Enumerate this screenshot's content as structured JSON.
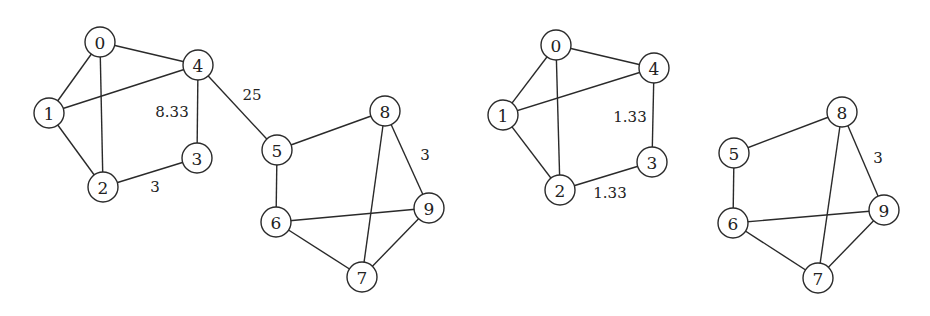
{
  "style": {
    "stroke": "#2a2a2a",
    "background": "#ffffff",
    "node_radius": 15
  },
  "graphs": [
    {
      "name": "left-graph",
      "nodes": [
        {
          "id": "0",
          "x": 100,
          "y": 42
        },
        {
          "id": "1",
          "x": 49,
          "y": 113
        },
        {
          "id": "2",
          "x": 103,
          "y": 187
        },
        {
          "id": "3",
          "x": 197,
          "y": 158
        },
        {
          "id": "4",
          "x": 198,
          "y": 65
        },
        {
          "id": "5",
          "x": 277,
          "y": 150
        },
        {
          "id": "6",
          "x": 276,
          "y": 222
        },
        {
          "id": "7",
          "x": 362,
          "y": 277
        },
        {
          "id": "8",
          "x": 385,
          "y": 111
        },
        {
          "id": "9",
          "x": 429,
          "y": 208
        }
      ],
      "edges": [
        {
          "from": "0",
          "to": "1"
        },
        {
          "from": "0",
          "to": "4"
        },
        {
          "from": "0",
          "to": "2"
        },
        {
          "from": "1",
          "to": "4"
        },
        {
          "from": "1",
          "to": "2"
        },
        {
          "from": "2",
          "to": "3",
          "label": "3",
          "lx": 155,
          "ly": 187
        },
        {
          "from": "3",
          "to": "4",
          "label": "8.33",
          "lx": 172,
          "ly": 112
        },
        {
          "from": "4",
          "to": "5",
          "label": "25",
          "lx": 252,
          "ly": 95
        },
        {
          "from": "5",
          "to": "8"
        },
        {
          "from": "5",
          "to": "6"
        },
        {
          "from": "6",
          "to": "9"
        },
        {
          "from": "6",
          "to": "7"
        },
        {
          "from": "7",
          "to": "8"
        },
        {
          "from": "7",
          "to": "9"
        },
        {
          "from": "8",
          "to": "9",
          "label": "3",
          "lx": 425,
          "ly": 155
        }
      ]
    },
    {
      "name": "right-graph",
      "nodes": [
        {
          "id": "0",
          "x": 556,
          "y": 45
        },
        {
          "id": "1",
          "x": 503,
          "y": 115
        },
        {
          "id": "2",
          "x": 560,
          "y": 190
        },
        {
          "id": "3",
          "x": 652,
          "y": 162
        },
        {
          "id": "4",
          "x": 654,
          "y": 68
        },
        {
          "id": "5",
          "x": 734,
          "y": 153
        },
        {
          "id": "6",
          "x": 733,
          "y": 223
        },
        {
          "id": "7",
          "x": 818,
          "y": 278
        },
        {
          "id": "8",
          "x": 842,
          "y": 112
        },
        {
          "id": "9",
          "x": 884,
          "y": 210
        }
      ],
      "edges": [
        {
          "from": "0",
          "to": "1"
        },
        {
          "from": "0",
          "to": "4"
        },
        {
          "from": "0",
          "to": "2"
        },
        {
          "from": "1",
          "to": "4"
        },
        {
          "from": "1",
          "to": "2"
        },
        {
          "from": "2",
          "to": "3",
          "label": "1.33",
          "lx": 610,
          "ly": 193
        },
        {
          "from": "3",
          "to": "4",
          "label": "1.33",
          "lx": 630,
          "ly": 117
        },
        {
          "from": "5",
          "to": "8"
        },
        {
          "from": "5",
          "to": "6"
        },
        {
          "from": "6",
          "to": "9"
        },
        {
          "from": "6",
          "to": "7"
        },
        {
          "from": "7",
          "to": "8"
        },
        {
          "from": "7",
          "to": "9"
        },
        {
          "from": "8",
          "to": "9",
          "label": "3",
          "lx": 878,
          "ly": 158
        }
      ]
    }
  ]
}
